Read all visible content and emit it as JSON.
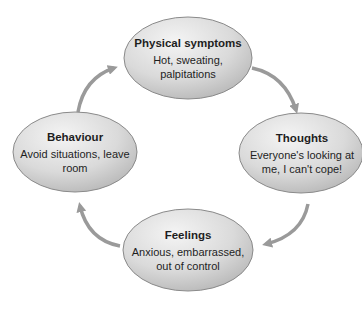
{
  "diagram": {
    "type": "cycle",
    "colors": {
      "ellipse_fill_light": "#f2f2f2",
      "ellipse_fill_dark": "#bdbdbd",
      "ellipse_stroke": "#8a8a8a",
      "arrow": "#999999",
      "text": "#1e1e1e"
    },
    "nodes": [
      {
        "id": "physical",
        "title": "Physical symptoms",
        "desc": "Hot, sweating, palpitations"
      },
      {
        "id": "thoughts",
        "title": "Thoughts",
        "desc": "Everyone's looking at me, I can't cope!"
      },
      {
        "id": "feelings",
        "title": "Feelings",
        "desc": "Anxious, embarrassed, out of control"
      },
      {
        "id": "behaviour",
        "title": "Behaviour",
        "desc": "Avoid situations, leave room"
      }
    ],
    "edges": [
      {
        "from": "physical",
        "to": "thoughts"
      },
      {
        "from": "thoughts",
        "to": "feelings"
      },
      {
        "from": "feelings",
        "to": "behaviour"
      },
      {
        "from": "behaviour",
        "to": "physical"
      }
    ]
  }
}
